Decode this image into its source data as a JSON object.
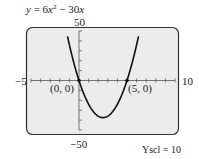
{
  "title": {
    "lhs": "y",
    "eq": " = 6",
    "x1": "x",
    "exp": "2",
    "minus": " − 30",
    "x2": "x"
  },
  "labels": {
    "ymax": "50",
    "ymin": "−50",
    "xmin": "−5",
    "xmax": "10",
    "p1": "(0, 0)",
    "p2": "(5, 0)",
    "yscl": "Yscl = 10"
  },
  "chart_data": {
    "type": "line",
    "xlabel": "",
    "ylabel": "",
    "xlim": [
      -5,
      10
    ],
    "ylim": [
      -50,
      50
    ],
    "xscl": 1,
    "yscl": 10,
    "grid": false,
    "series": [
      {
        "name": "y = 6x^2 - 30x",
        "function": "6*x^2-30*x",
        "x": [
          -1.1,
          0,
          1,
          2,
          2.5,
          3,
          4,
          5,
          6.1
        ],
        "y": [
          39.3,
          0,
          -24,
          -36,
          -37.5,
          -36,
          -24,
          0,
          40.3
        ]
      }
    ],
    "annotations": [
      {
        "text": "(0, 0)",
        "x": 0,
        "y": 0
      },
      {
        "text": "(5, 0)",
        "x": 5,
        "y": 0
      },
      {
        "text": "Yscl = 10"
      }
    ],
    "colors": {
      "screen": "#ececec",
      "curve": "#111111",
      "frame": "#333333"
    }
  }
}
